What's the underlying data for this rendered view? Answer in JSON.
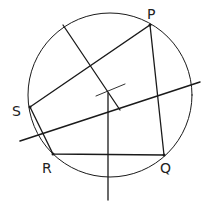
{
  "diagram": {
    "stroke_color": "#1a1a1a",
    "circle": {
      "cx": 110,
      "cy": 95,
      "r": 82
    },
    "center": {
      "x": 108,
      "y": 93
    },
    "points": {
      "P": {
        "label": "P",
        "x": 150,
        "y": 25,
        "lx": 147,
        "ly": 19
      },
      "Q": {
        "label": "Q",
        "x": 164,
        "y": 155,
        "lx": 160,
        "ly": 173
      },
      "R": {
        "label": "R",
        "x": 53,
        "y": 154,
        "lx": 42,
        "ly": 173
      },
      "S": {
        "label": "S",
        "x": 30,
        "y": 107,
        "lx": 12,
        "ly": 116
      }
    },
    "labels": {
      "P": "P",
      "Q": "Q",
      "R": "R",
      "S": "S"
    },
    "bisectors": [
      {
        "name": "bisector-SP",
        "x1": 63,
        "y1": 25,
        "x2": 120,
        "y2": 110
      },
      {
        "name": "bisector-PQ",
        "x1": 20,
        "y1": 141,
        "x2": 200,
        "y2": 82
      },
      {
        "name": "bisector-RQ",
        "x1": 108,
        "y1": 93,
        "x2": 108,
        "y2": 200
      },
      {
        "name": "bisector-SR-mark",
        "x1": 96,
        "y1": 96,
        "x2": 125,
        "y2": 84
      }
    ]
  }
}
